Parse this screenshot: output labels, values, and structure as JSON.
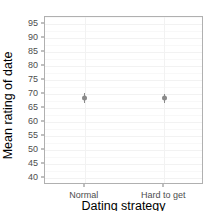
{
  "chart_data": {
    "type": "scatter",
    "title": "",
    "subtitle": "",
    "xlabel": "Dating strategy",
    "ylabel": "Mean rating of date",
    "categories": [
      "Normal",
      "Hard to get"
    ],
    "values": [
      68.5,
      68.5
    ],
    "error_low": [
      66.8,
      66.9
    ],
    "error_high": [
      70.2,
      70.1
    ],
    "series": [
      {
        "name": "Mean rating of date",
        "values": [
          68.5,
          68.5
        ],
        "error_low": [
          66.8,
          66.9
        ],
        "error_high": [
          70.2,
          70.1
        ]
      }
    ],
    "ylim": [
      37.5,
      97.5
    ],
    "yticks": [
      40,
      45,
      50,
      55,
      60,
      65,
      70,
      75,
      80,
      85,
      90,
      95
    ],
    "ytick_labels": [
      "40",
      "45",
      "50",
      "55",
      "60",
      "65",
      "70",
      "75",
      "80",
      "85",
      "90",
      "95"
    ],
    "grid": true,
    "grid_color": "#f2f2f2",
    "legend": "none",
    "point_color": "#8a8a8a",
    "panel_border_color": "#b0b0b0",
    "panel_background": "#ffffff",
    "marker": "point-with-errorbar"
  },
  "axes": {
    "y": {
      "label": "Mean rating of date",
      "ticks": [
        {
          "value": 95,
          "label": "95"
        },
        {
          "value": 90,
          "label": "90"
        },
        {
          "value": 85,
          "label": "85"
        },
        {
          "value": 80,
          "label": "80"
        },
        {
          "value": 75,
          "label": "75"
        },
        {
          "value": 70,
          "label": "70"
        },
        {
          "value": 65,
          "label": "65"
        },
        {
          "value": 60,
          "label": "60"
        },
        {
          "value": 55,
          "label": "55"
        },
        {
          "value": 50,
          "label": "50"
        },
        {
          "value": 45,
          "label": "45"
        },
        {
          "value": 40,
          "label": "40"
        }
      ]
    },
    "x": {
      "label": "Dating strategy",
      "ticks": [
        {
          "label": "Normal"
        },
        {
          "label": "Hard to get"
        }
      ]
    }
  }
}
